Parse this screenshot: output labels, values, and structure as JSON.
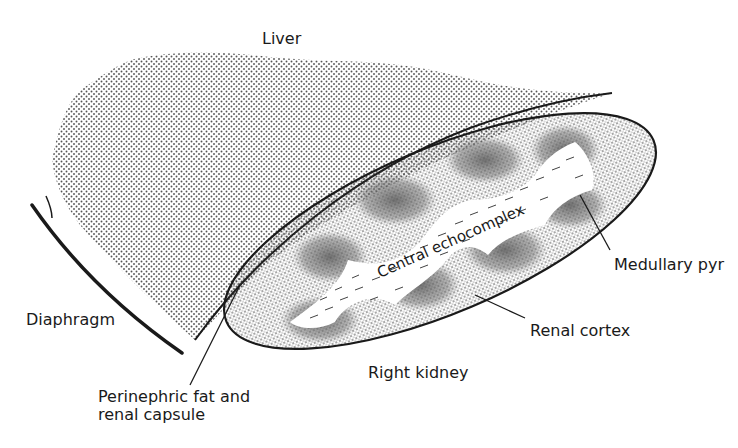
{
  "diagram": {
    "type": "anatomical-ultrasound-schematic",
    "colors": {
      "background": "#ffffff",
      "ink": "#1a1a1a",
      "liver_dots": "#555555",
      "cortex_dots": "#333333",
      "pyramid_shade": "#6a6a6a"
    },
    "labels": {
      "liver": "Liver",
      "diaphragm": "Diaphragm",
      "perinephric_line1": "Perinephric fat and",
      "perinephric_line2": "renal capsule",
      "central_echocomplex": "Central echocomplex",
      "medullary_pyr": "Medullary pyr",
      "renal_cortex": "Renal cortex",
      "right_kidney": "Right kidney"
    }
  }
}
